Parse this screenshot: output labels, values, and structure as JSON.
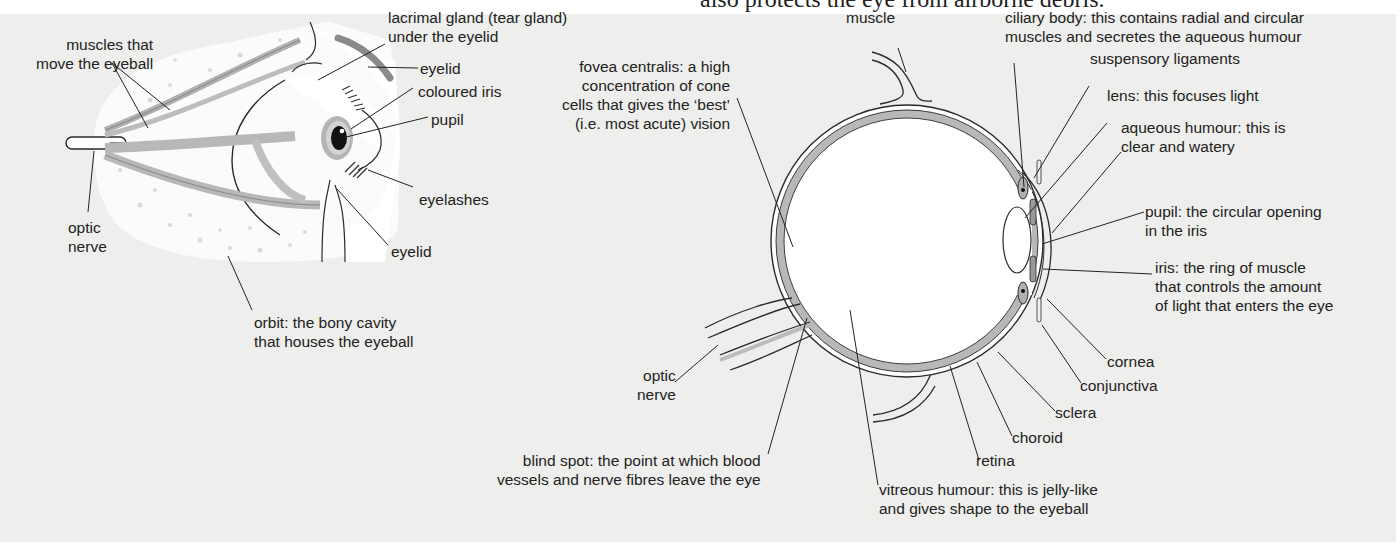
{
  "header": {
    "cropped_caption": "also protects the eye from airborne debris."
  },
  "left_figure": {
    "title": "external eye with muscles (side view)",
    "labels": {
      "muscles": [
        "muscles that",
        "move the eyeball"
      ],
      "optic_nerve": [
        "optic",
        "nerve"
      ],
      "lacrimal": [
        "lacrimal gland (tear gland)",
        "under the eyelid"
      ],
      "eyelid_top": "eyelid",
      "iris": "coloured iris",
      "pupil": "pupil",
      "eyelashes": "eyelashes",
      "eyelid_bottom": "eyelid",
      "orbit": [
        "orbit: the bony cavity",
        "that houses the eyeball"
      ]
    }
  },
  "right_figure": {
    "title": "cross-section of the eye",
    "labels": {
      "muscle": "muscle",
      "ciliary_body": [
        "ciliary body: this contains radial and circular",
        "muscles and secretes the aqueous humour"
      ],
      "suspensory": "suspensory ligaments",
      "lens": "lens: this focuses light",
      "aqueous": [
        "aqueous humour: this is",
        "clear and watery"
      ],
      "pupil": [
        "pupil: the circular opening",
        "in the iris"
      ],
      "iris": [
        "iris: the ring of muscle",
        "that controls the amount",
        "of light that enters the eye"
      ],
      "cornea": "cornea",
      "conjunctiva": "conjunctiva",
      "sclera": "sclera",
      "choroid": "choroid",
      "retina": "retina",
      "vitreous": [
        "vitreous humour: this is jelly-like",
        "and gives shape to the eyeball"
      ],
      "blind_spot": [
        "blind spot: the point at which blood",
        "vessels and nerve fibres leave the eye"
      ],
      "optic_nerve": [
        "optic",
        "nerve"
      ],
      "fovea": [
        "fovea centralis: a high",
        "concentration of cone",
        "cells that gives the ‘best’",
        "(i.e. most acute) vision"
      ]
    }
  },
  "colors": {
    "panel_bg": "#eeeeec",
    "tissue_grey": "#b8b8b8",
    "outline": "#2a2a2a",
    "orbit_fill": "#fafafa"
  }
}
